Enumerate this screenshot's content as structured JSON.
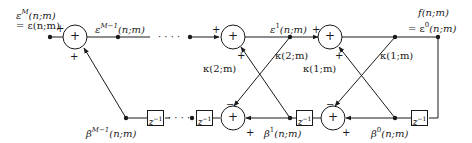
{
  "diagram": {
    "type": "lattice-filter",
    "stroke_color": "#1a1a1a",
    "labels": {
      "input_top_line1_base": "ε",
      "input_top_line1_sup": "M",
      "input_top_line1_arg": "(n;m)",
      "input_top_line2": "= ε(n;m)",
      "eps_M1_base": "ε",
      "eps_M1_sup": "M−1",
      "eps_M1_arg": "(n;m)",
      "eps_1_base": "ε",
      "eps_1_sup": "1",
      "eps_1_arg": "(n;m)",
      "f_line1": "f(n;m)",
      "f_line2_prefix": "= ε",
      "f_line2_sup": "0",
      "f_line2_arg": "(n;m)",
      "kappa2_upper": "κ(2;m)",
      "kappa2_lower": "κ(2;m)",
      "kappa1_upper": "κ(1;m)",
      "kappa1_lower": "κ(1;m)",
      "beta_M1_base": "β",
      "beta_M1_sup": "M−1",
      "beta_M1_arg": "(n;m)",
      "beta_1_base": "β",
      "beta_1_sup": "1",
      "beta_1_arg": "(n;m)",
      "beta_0_base": "β",
      "beta_0_sup": "0",
      "beta_0_arg": "(n;m)",
      "dots": "· · · ·"
    },
    "adder_symbol": "+",
    "signs": {
      "plus": "+",
      "minus": "−"
    },
    "delay": {
      "base": "z",
      "sup": "−1"
    }
  }
}
